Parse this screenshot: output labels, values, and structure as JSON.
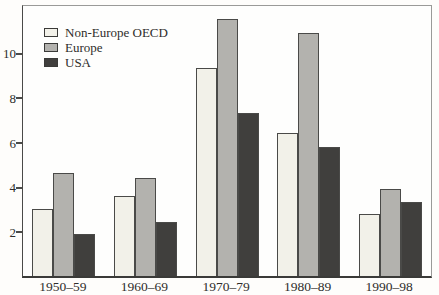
{
  "chart_data": {
    "type": "bar",
    "title": "",
    "xlabel": "",
    "ylabel": "",
    "categories": [
      "1950–59",
      "1960–69",
      "1970–79",
      "1980–89",
      "1990–98"
    ],
    "series": [
      {
        "name": "Non-Europe OECD",
        "color": "#f2f1e9",
        "values": [
          3.0,
          3.6,
          9.3,
          6.4,
          2.8
        ]
      },
      {
        "name": "Europe",
        "color": "#b3b2ae",
        "values": [
          4.6,
          4.4,
          11.5,
          10.9,
          3.9
        ]
      },
      {
        "name": "USA",
        "color": "#403f3d",
        "values": [
          1.9,
          2.4,
          7.3,
          5.8,
          3.3
        ]
      }
    ],
    "yticks": [
      2,
      4,
      6,
      8,
      10
    ],
    "ylim": [
      0,
      12.1
    ],
    "grid": false,
    "legend_position": "top-left",
    "colors": {
      "bar_border": "#4a4a48",
      "frame": "#9a9a98",
      "axis": "#3a3a38",
      "text": "#2e2d2b",
      "background": "#fefdfb"
    }
  }
}
